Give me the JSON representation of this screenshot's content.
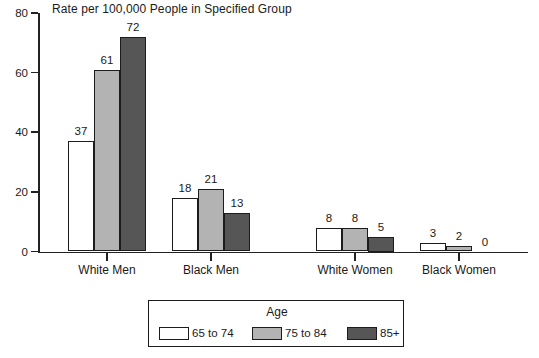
{
  "chart_data": {
    "type": "bar",
    "title": "Rate per 100,000 People in Specified Group",
    "xlabel": "",
    "ylabel": "",
    "ylim": [
      0,
      80
    ],
    "yticks": [
      0,
      20,
      40,
      60,
      80
    ],
    "grid": false,
    "legend_position": "bottom",
    "legend_title": "Age",
    "categories": [
      "White Men",
      "Black Men",
      "White Women",
      "Black Women"
    ],
    "series": [
      {
        "name": "65 to 74",
        "color": "#ffffff",
        "values": [
          37,
          18,
          8,
          3
        ]
      },
      {
        "name": "75 to 84",
        "color": "#b3b3b3",
        "values": [
          61,
          21,
          8,
          2
        ]
      },
      {
        "name": "85+",
        "color": "#565656",
        "values": [
          72,
          13,
          5,
          0
        ]
      }
    ],
    "value_labels": {
      "White Men": [
        "37",
        "61",
        "72"
      ],
      "Black Men": [
        "18",
        "21",
        "13"
      ],
      "White Women": [
        "8",
        "8",
        "5"
      ],
      "Black Women": [
        "3",
        "2",
        "0"
      ]
    }
  },
  "axis": {
    "y_tick_labels": [
      "0",
      "20",
      "40",
      "60",
      "80"
    ],
    "x_tick_labels": [
      "White Men",
      "Black Men",
      "White Women",
      "Black Women"
    ]
  },
  "legend": {
    "title": "Age",
    "items": [
      {
        "label": "65 to 74",
        "color": "#ffffff"
      },
      {
        "label": "75 to 84",
        "color": "#b3b3b3"
      },
      {
        "label": "85+",
        "color": "#565656"
      }
    ]
  },
  "colors": {
    "axis": "#222222",
    "text": "#1a1a1a",
    "bar_edge": "#1c1c1c",
    "series_1": "#ffffff",
    "series_2": "#b3b3b3",
    "series_3": "#565656",
    "background": "#ffffff"
  }
}
